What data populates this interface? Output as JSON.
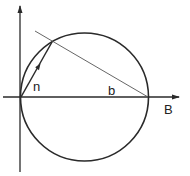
{
  "diagram": {
    "labels": {
      "n": "n",
      "b": "b",
      "B": "B"
    },
    "colors": {
      "stroke": "#2a2a2a",
      "thin_line": "#555555",
      "background": "#ffffff"
    },
    "elements": {
      "vertical_axis": {
        "x": 20,
        "y_top": 5,
        "y_bottom": 172
      },
      "horizontal_axis": {
        "y": 97,
        "x_left": 3,
        "x_right": 180
      },
      "circle": {
        "cx": 84.5,
        "cy": 97,
        "r": 64
      },
      "chord_line": {
        "x1": 35,
        "y1": 31,
        "x2": 148,
        "y2": 97
      },
      "vector_n": {
        "x1": 21,
        "y1": 97,
        "x2": 52,
        "y2": 42
      }
    }
  }
}
